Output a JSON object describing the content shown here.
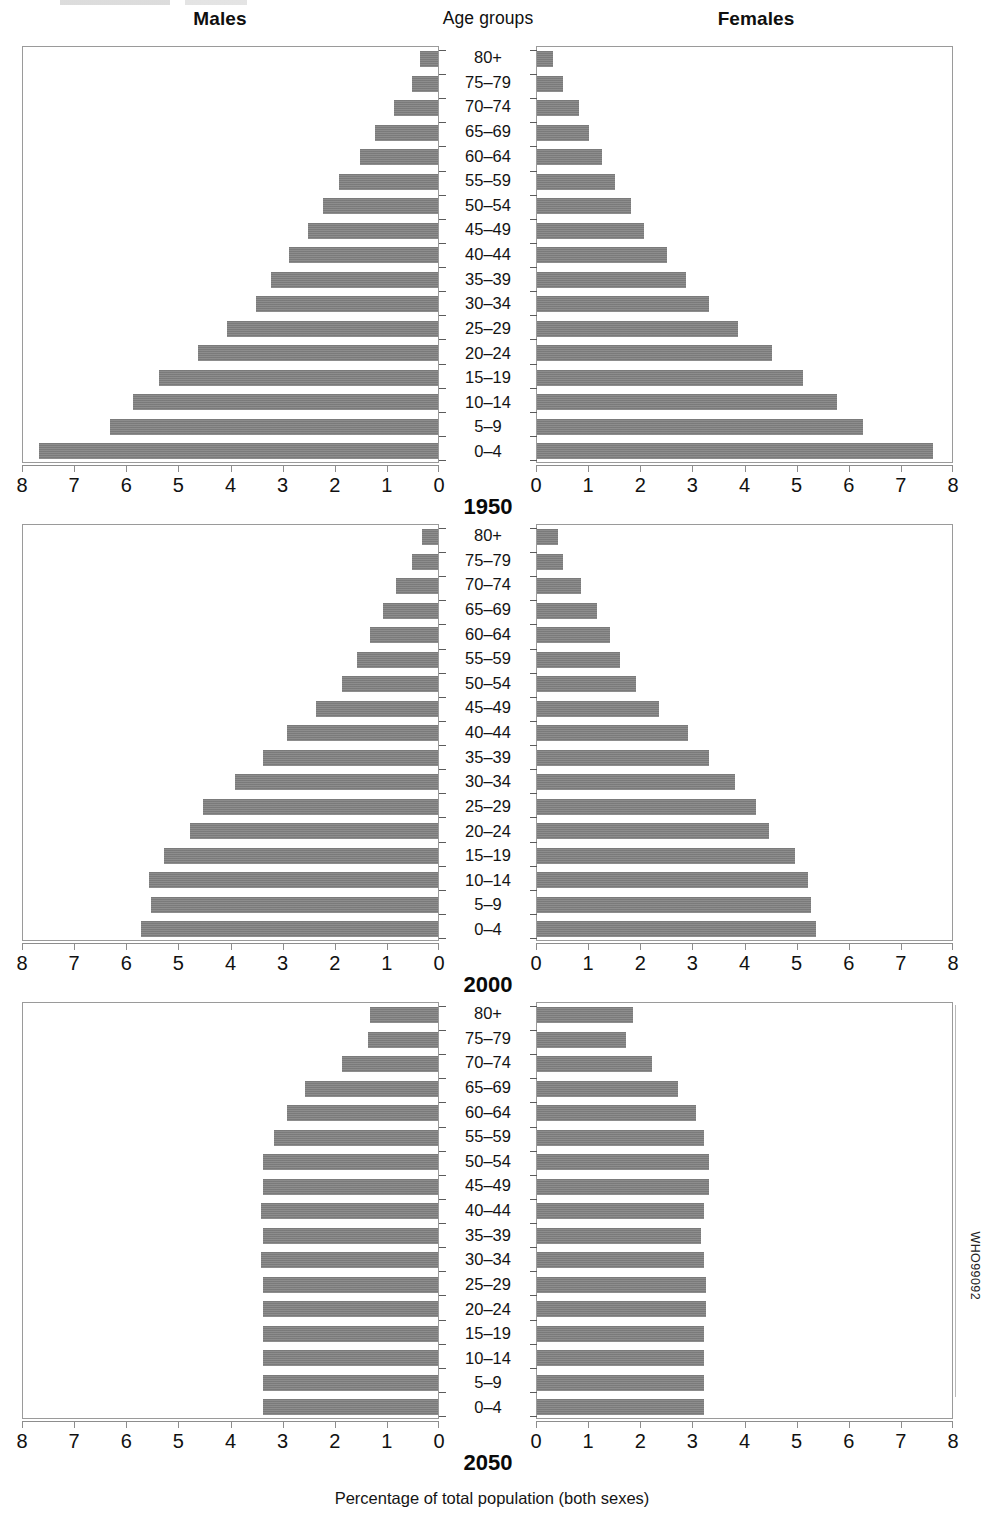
{
  "header": {
    "males": "Males",
    "age_groups": "Age groups",
    "females": "Females"
  },
  "footer": {
    "caption": "Percentage of total population (both sexes)",
    "who_code": "WHO99092"
  },
  "axis": {
    "tick_labels_left": [
      "8",
      "7",
      "6",
      "5",
      "4",
      "3",
      "2",
      "1",
      "0"
    ],
    "tick_labels_right": [
      "0",
      "1",
      "2",
      "3",
      "4",
      "5",
      "6",
      "7",
      "8"
    ]
  },
  "panels": [
    {
      "year": "1950"
    },
    {
      "year": "2000"
    },
    {
      "year": "2050"
    }
  ],
  "chart_data": {
    "type": "bar",
    "subtype": "population-pyramid",
    "xlabel": "Percentage of total population (both sexes)",
    "ylabel": "Age groups",
    "xlim": [
      0,
      8
    ],
    "xticks": [
      0,
      1,
      2,
      3,
      4,
      5,
      6,
      7,
      8
    ],
    "grid": false,
    "legend": [
      "Males",
      "Females"
    ],
    "legend_position": "top",
    "categories": [
      "80+",
      "75-79",
      "70-74",
      "65-69",
      "60-64",
      "55-59",
      "50-54",
      "45-49",
      "40-44",
      "35-39",
      "30-34",
      "25-29",
      "20-24",
      "15-19",
      "10-14",
      "5-9",
      "0-4"
    ],
    "panels": [
      {
        "year": "1950",
        "series": [
          {
            "name": "Males",
            "values": [
              0.35,
              0.5,
              0.85,
              1.2,
              1.5,
              1.9,
              2.2,
              2.5,
              2.85,
              3.2,
              3.5,
              4.05,
              4.6,
              5.35,
              5.85,
              6.3,
              7.65
            ]
          },
          {
            "name": "Females",
            "values": [
              0.3,
              0.5,
              0.8,
              1.0,
              1.25,
              1.5,
              1.8,
              2.05,
              2.5,
              2.85,
              3.3,
              3.85,
              4.5,
              5.1,
              5.75,
              6.25,
              7.6
            ]
          }
        ]
      },
      {
        "year": "2000",
        "series": [
          {
            "name": "Males",
            "values": [
              0.3,
              0.5,
              0.8,
              1.05,
              1.3,
              1.55,
              1.85,
              2.35,
              2.9,
              3.35,
              3.9,
              4.5,
              4.75,
              5.25,
              5.55,
              5.5,
              5.7
            ]
          },
          {
            "name": "Females",
            "values": [
              0.4,
              0.5,
              0.85,
              1.15,
              1.4,
              1.6,
              1.9,
              2.35,
              2.9,
              3.3,
              3.8,
              4.2,
              4.45,
              4.95,
              5.2,
              5.25,
              5.35
            ]
          }
        ]
      },
      {
        "year": "2050",
        "series": [
          {
            "name": "Males",
            "values": [
              1.3,
              1.35,
              1.85,
              2.55,
              2.9,
              3.15,
              3.35,
              3.35,
              3.4,
              3.35,
              3.4,
              3.35,
              3.35,
              3.35,
              3.35,
              3.35,
              3.35
            ]
          },
          {
            "name": "Females",
            "values": [
              1.85,
              1.7,
              2.2,
              2.7,
              3.05,
              3.2,
              3.3,
              3.3,
              3.2,
              3.15,
              3.2,
              3.25,
              3.25,
              3.2,
              3.2,
              3.2,
              3.2
            ]
          }
        ]
      }
    ]
  },
  "style": {
    "bar_color": "#808080",
    "axis_color": "#8d8d8d",
    "frame_color": "#9a9a9a",
    "text_color": "#111111"
  }
}
